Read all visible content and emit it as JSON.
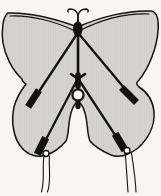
{
  "meta": {
    "type": "illustration",
    "alt": "Black-and-white line drawing of a butterfly-shaped kite with shaded wings, curled antennae, a central spine and tow ring, crossed diagonal spars ending in black spar pockets, and two pairs of tail streamers hanging from the lower wings."
  },
  "colors": {
    "background": "#f7f6f4",
    "wing_fill": "#d6d5d3",
    "wing_texture": "#c9c8c5",
    "line": "#121212",
    "ring_fill": "#ffffff"
  },
  "parts": {
    "wings": "four shaded butterfly wings (single silhouette with bell-shaped gap between lower wings)",
    "antennae": "two curled antennae at the top of the head",
    "head": "black head and body at the top center",
    "leading_edges": "double-line bowed leading edges along the upper wings",
    "spine": "central vertical spine with lashed center fitting",
    "upper_spars": "diagonal spars from head to mid-wing pockets",
    "lower_spars": "diagonal spars from center fitting to lower wing corners",
    "pockets": "four black spar pockets at wing edges",
    "tow_ring": "white circular tow ring at center with knot below",
    "tail_loops": "small white attachment loops at lower wing corners",
    "tails": "two pairs of wavy tail streamers"
  }
}
